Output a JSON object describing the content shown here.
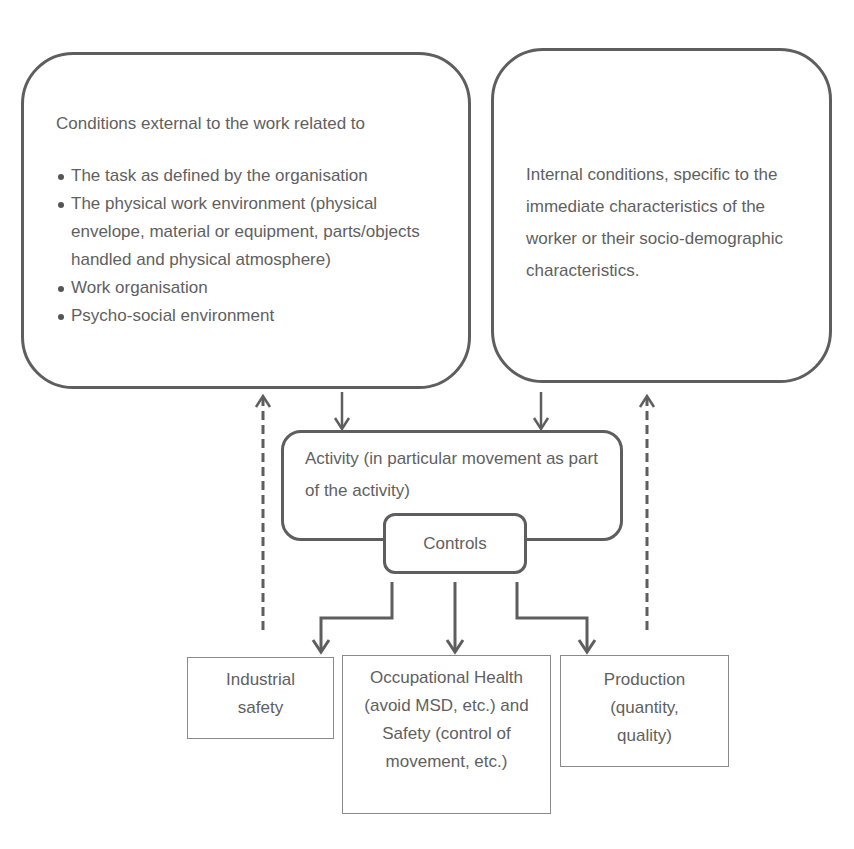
{
  "diagram": {
    "external_conditions": {
      "heading": "Conditions external to the work related to",
      "items": [
        "The task as defined by the organisation",
        "The  physical work environment (physical envelope, material or equipment, parts/objects handled and physical atmosphere)",
        "Work organisation",
        "Psycho-social environment"
      ]
    },
    "internal_conditions": {
      "text": "Internal conditions, specific to the immediate characteristics of the worker or their socio-demographic characteristics."
    },
    "activity": {
      "text": "Activity (in particular movement as part of the activity)"
    },
    "controls": {
      "label": "Controls"
    },
    "outcomes": [
      {
        "label": "Industrial safety"
      },
      {
        "label": "Occupational Health (avoid MSD, etc.) and Safety (control of movement, etc.)"
      },
      {
        "label": "Production (quantity, quality)"
      }
    ],
    "colors": {
      "stroke": "#5e5e5e",
      "thin_border": "#8a8a8a",
      "text": "#5f5f5f",
      "background": "#ffffff"
    }
  }
}
